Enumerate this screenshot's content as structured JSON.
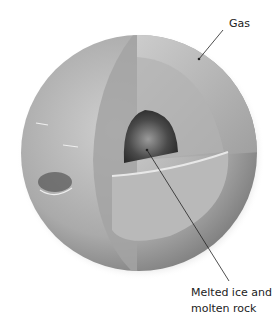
{
  "diagram": {
    "labels": {
      "gas": "Gas",
      "core_line1": "Melted ice and",
      "core_line2": "molten rock"
    },
    "colors": {
      "outer": "#b5b5b5",
      "cut_face": "#c8c8c8",
      "inner_layer": "#a8a8a8",
      "core": "#3a3a3a",
      "leader_line": "#222222"
    }
  }
}
